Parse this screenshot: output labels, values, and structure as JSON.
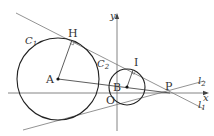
{
  "diagram": {
    "axes": {
      "x_label": "x",
      "y_label": "y",
      "origin_label": "O",
      "color": "#555555"
    },
    "circles": [
      {
        "name": "C",
        "subscript": "1",
        "center_label": "A",
        "color": "#222222"
      },
      {
        "name": "C",
        "subscript": "2",
        "center_label": "B",
        "color": "#222222"
      }
    ],
    "points": {
      "H": "H",
      "I": "I",
      "P": "P",
      "A": "A",
      "B": "B",
      "O": "O"
    },
    "lines": [
      {
        "name": "l",
        "subscript": "1",
        "description": "common tangent through H, I and P"
      },
      {
        "name": "l",
        "subscript": "2",
        "description": "lower common tangent through P"
      }
    ],
    "line_color": "#666666"
  }
}
